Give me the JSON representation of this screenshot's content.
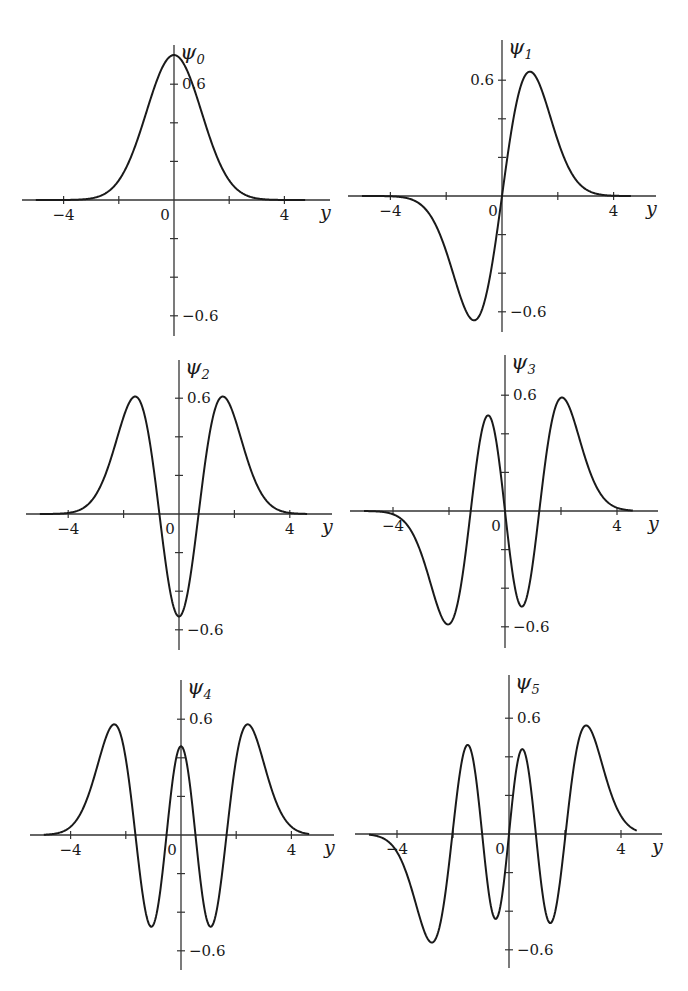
{
  "figure": {
    "colors": {
      "curve": "#1a1a1a",
      "axis": "#333333",
      "background": "#ffffff"
    }
  },
  "chart_data": [
    {
      "type": "line",
      "title": "ψ0",
      "ylabel_symbol": "ψ",
      "ylabel_subscript": "0",
      "xlabel": "y",
      "function": "hermite_function",
      "n": 0,
      "xlim": [
        -5,
        5
      ],
      "ylim": [
        -0.75,
        0.8
      ],
      "x_ticks": [
        -4,
        -2,
        0,
        2,
        4
      ],
      "x_tick_labels": [
        {
          "value": -4,
          "text": "−4"
        },
        {
          "value": 0,
          "text": "0"
        },
        {
          "value": 4,
          "text": "4"
        }
      ],
      "y_ticks": [
        -0.6,
        -0.4,
        -0.2,
        0.2,
        0.4,
        0.6
      ],
      "y_tick_labels": [
        {
          "value": 0.6,
          "text": "0.6"
        },
        {
          "value": -0.6,
          "text": "−0.6"
        }
      ],
      "peak": {
        "x": 0,
        "y": 0.75
      },
      "grid": false
    },
    {
      "type": "line",
      "title": "ψ1",
      "ylabel_symbol": "ψ",
      "ylabel_subscript": "1",
      "xlabel": "y",
      "function": "hermite_function",
      "n": 1,
      "xlim": [
        -5,
        5
      ],
      "ylim": [
        -0.75,
        0.8
      ],
      "x_ticks": [
        -4,
        -2,
        0,
        2,
        4
      ],
      "x_tick_labels": [
        {
          "value": -4,
          "text": "−4"
        },
        {
          "value": 0,
          "text": "0"
        },
        {
          "value": 4,
          "text": "4"
        }
      ],
      "y_ticks": [
        -0.6,
        -0.4,
        -0.2,
        0.2,
        0.4,
        0.6
      ],
      "y_tick_labels": [
        {
          "value": 0.6,
          "text": "0.6"
        },
        {
          "value": -0.6,
          "text": "−0.6"
        }
      ],
      "extrema": [
        {
          "x": -1,
          "y": -0.64
        },
        {
          "x": 1,
          "y": 0.64
        }
      ],
      "grid": false
    },
    {
      "type": "line",
      "title": "ψ2",
      "ylabel_symbol": "ψ",
      "ylabel_subscript": "2",
      "xlabel": "y",
      "function": "hermite_function",
      "n": 2,
      "xlim": [
        -5,
        5
      ],
      "ylim": [
        -0.75,
        0.8
      ],
      "x_ticks": [
        -4,
        -2,
        0,
        2,
        4
      ],
      "x_tick_labels": [
        {
          "value": -4,
          "text": "−4"
        },
        {
          "value": 0,
          "text": "0"
        },
        {
          "value": 4,
          "text": "4"
        }
      ],
      "y_ticks": [
        -0.6,
        -0.4,
        -0.2,
        0.2,
        0.4,
        0.6
      ],
      "y_tick_labels": [
        {
          "value": 0.6,
          "text": "0.6"
        },
        {
          "value": -0.6,
          "text": "−0.6"
        }
      ],
      "extrema": [
        {
          "x": -1.58,
          "y": 0.6
        },
        {
          "x": 0,
          "y": -0.53
        },
        {
          "x": 1.58,
          "y": 0.6
        }
      ],
      "grid": false
    },
    {
      "type": "line",
      "title": "ψ3",
      "ylabel_symbol": "ψ",
      "ylabel_subscript": "3",
      "xlabel": "y",
      "function": "hermite_function",
      "n": 3,
      "xlim": [
        -5,
        5
      ],
      "ylim": [
        -0.75,
        0.8
      ],
      "x_ticks": [
        -4,
        -2,
        0,
        2,
        4
      ],
      "x_tick_labels": [
        {
          "value": -4,
          "text": "−4"
        },
        {
          "value": 0,
          "text": "0"
        },
        {
          "value": 4,
          "text": "4"
        }
      ],
      "y_ticks": [
        -0.6,
        -0.4,
        -0.2,
        0.2,
        0.4,
        0.6
      ],
      "y_tick_labels": [
        {
          "value": 0.6,
          "text": "0.6"
        },
        {
          "value": -0.6,
          "text": "−0.6"
        }
      ],
      "extrema": [
        {
          "x": -1.9,
          "y": -0.58
        },
        {
          "x": -0.6,
          "y": 0.48
        },
        {
          "x": 0.6,
          "y": -0.48
        },
        {
          "x": 1.9,
          "y": 0.58
        }
      ],
      "grid": false
    },
    {
      "type": "line",
      "title": "ψ4",
      "ylabel_symbol": "ψ",
      "ylabel_subscript": "4",
      "xlabel": "y",
      "function": "hermite_function",
      "n": 4,
      "xlim": [
        -5,
        5
      ],
      "ylim": [
        -0.75,
        0.8
      ],
      "x_ticks": [
        -4,
        -2,
        0,
        2,
        4
      ],
      "x_tick_labels": [
        {
          "value": -4,
          "text": "−4"
        },
        {
          "value": 0,
          "text": "0"
        },
        {
          "value": 4,
          "text": "4"
        }
      ],
      "y_ticks": [
        -0.6,
        -0.4,
        -0.2,
        0.2,
        0.4,
        0.6
      ],
      "y_tick_labels": [
        {
          "value": 0.6,
          "text": "0.6"
        },
        {
          "value": -0.6,
          "text": "−0.6"
        }
      ],
      "extrema": [
        {
          "x": -2.2,
          "y": 0.56
        },
        {
          "x": -1.0,
          "y": -0.48
        },
        {
          "x": 0,
          "y": 0.41
        },
        {
          "x": 1.0,
          "y": -0.48
        },
        {
          "x": 2.2,
          "y": 0.56
        }
      ],
      "grid": false
    },
    {
      "type": "line",
      "title": "ψ5",
      "ylabel_symbol": "ψ",
      "ylabel_subscript": "5",
      "xlabel": "y",
      "function": "hermite_function",
      "n": 5,
      "xlim": [
        -5,
        5
      ],
      "ylim": [
        -0.75,
        0.8
      ],
      "x_ticks": [
        -4,
        -2,
        0,
        2,
        4
      ],
      "x_tick_labels": [
        {
          "value": -4,
          "text": "−4"
        },
        {
          "value": 0,
          "text": "0"
        },
        {
          "value": 4,
          "text": "4"
        }
      ],
      "y_ticks": [
        -0.6,
        -0.4,
        -0.2,
        0.2,
        0.4,
        0.6
      ],
      "y_tick_labels": [
        {
          "value": 0.6,
          "text": "0.6"
        },
        {
          "value": -0.6,
          "text": "−0.6"
        }
      ],
      "extrema": [
        {
          "x": -2.5,
          "y": -0.55
        },
        {
          "x": -1.4,
          "y": 0.46
        },
        {
          "x": -0.45,
          "y": -0.43
        },
        {
          "x": 0.45,
          "y": 0.43
        },
        {
          "x": 1.4,
          "y": -0.46
        },
        {
          "x": 2.5,
          "y": 0.55
        }
      ],
      "grid": false
    }
  ]
}
